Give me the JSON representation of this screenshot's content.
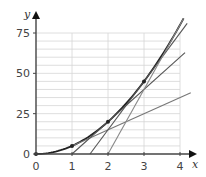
{
  "chart_data": {
    "type": "line",
    "title": "",
    "xlabel": "x",
    "ylabel": "y",
    "xlim": [
      0,
      4
    ],
    "ylim": [
      0,
      75
    ],
    "x_ticks": [
      "0",
      "1",
      "2",
      "3",
      "4"
    ],
    "y_ticks": [
      "0",
      "25",
      "50",
      "75"
    ],
    "grid": true,
    "grid_minor_y_step": 5,
    "legend": "none",
    "series": [
      {
        "name": "curve y = 5x^2",
        "kind": "curve",
        "x": [
          0,
          0.5,
          1,
          1.5,
          2,
          2.5,
          3,
          3.5,
          4,
          4.1
        ],
        "values": [
          0,
          1.25,
          5,
          11.25,
          20,
          31.25,
          45,
          61.25,
          80,
          84.05
        ],
        "color": "#222222"
      },
      {
        "name": "tangent at x=1 (y = 10x - 5)",
        "kind": "line",
        "x": [
          1,
          4.3
        ],
        "values": [
          5,
          38
        ],
        "color": "#777777"
      },
      {
        "name": "tangent at x=2 (y = 20x - 20)",
        "kind": "line",
        "x": [
          1,
          4.14
        ],
        "values": [
          0,
          62.8
        ],
        "color": "#555555"
      },
      {
        "name": "tangent at x=3 (y = 30x - 45)",
        "kind": "line",
        "x": [
          1.5,
          4.2
        ],
        "values": [
          0,
          81
        ],
        "color": "#555555"
      },
      {
        "name": "tangent at x=4 (y = 40x - 80)",
        "kind": "line",
        "x": [
          2,
          4.1
        ],
        "values": [
          0,
          84
        ],
        "color": "#888888"
      }
    ],
    "points": [
      {
        "x": 0,
        "y": 0
      },
      {
        "x": 1,
        "y": 5
      },
      {
        "x": 2,
        "y": 20
      },
      {
        "x": 3,
        "y": 45
      }
    ]
  },
  "axes": {
    "x_label": "x",
    "y_label": "y",
    "x_tick_labels": [
      "0",
      "1",
      "2",
      "3",
      "4"
    ],
    "y_tick_labels": [
      "0",
      "25",
      "50",
      "75"
    ]
  }
}
